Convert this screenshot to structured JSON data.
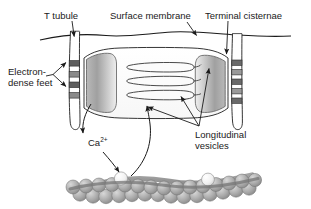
{
  "figure": {
    "background_color": "#ffffff",
    "line_color": "#1a1a1a",
    "fill_gray_dark": "#8c8c8c",
    "fill_gray_mid": "#b5b5b5",
    "fill_gray_light": "#e6e6e6",
    "bead_color": "#a8a8a8",
    "bead_highlight": "#f2f2f2"
  },
  "labels": {
    "t_tubule": "T tubule",
    "surface_membrane": "Surface membrane",
    "terminal_cisternae": "Terminal cisternae",
    "electron_dense_feet_line1": "Electron-",
    "electron_dense_feet_line2": "dense feet",
    "calcium_ion": "Ca",
    "calcium_ion_charge": "2+",
    "longitudinal_vesicles_line1": "Longitudinal",
    "longitudinal_vesicles_line2": "vesicles"
  },
  "structures": {
    "surface_membrane": "wavy-horizontal-membrane-line",
    "t_tubule_left": "vertical-narrow-tubule",
    "t_tubule_right": "vertical-narrow-tubule",
    "terminal_cisterna_left": "shaded-bulbous-sac",
    "terminal_cisterna_right": "shaded-bulbous-sac",
    "longitudinal_vesicles": "three-horizontal-tubules",
    "electron_dense_feet_left": "four-dark-squares",
    "electron_dense_feet_right": "five-dark-squares",
    "myofilament": "double-helix-bead-filament",
    "calcium_release_arrow": "curved-arrow-down",
    "calcium_binding_arrow": "curved-arrow-up"
  }
}
